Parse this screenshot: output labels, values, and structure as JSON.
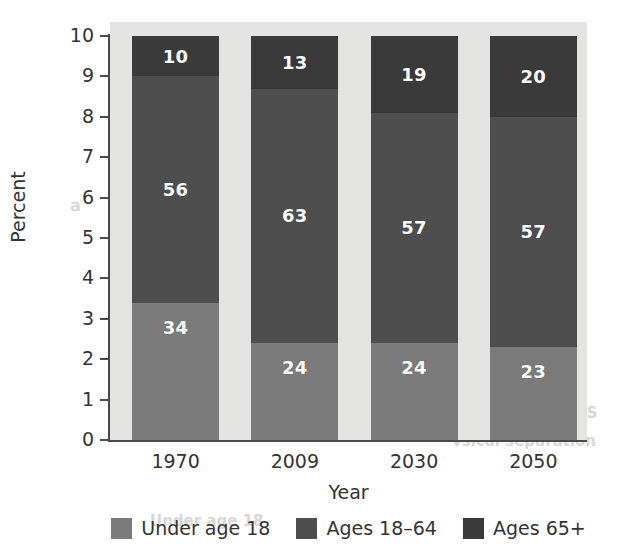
{
  "chart_data": {
    "type": "bar",
    "subtype": "stacked-bar",
    "title": "",
    "xlabel": "Year",
    "ylabel": "Percent",
    "categories": [
      "1970",
      "2009",
      "2030",
      "2050"
    ],
    "series": [
      {
        "name": "Under age 18",
        "values": [
          34,
          24,
          24,
          23
        ],
        "color": "#7b7b7b"
      },
      {
        "name": "Ages 18–64",
        "values": [
          56,
          63,
          57,
          57
        ],
        "color": "#4e4e4e"
      },
      {
        "name": "Ages 65+",
        "values": [
          10,
          13,
          19,
          20
        ],
        "color": "#3a3a3a"
      }
    ],
    "stack_order": [
      "Under age 18",
      "Ages 18–64",
      "Ages 65+"
    ],
    "ylim": [
      0,
      10
    ],
    "yticks": [
      0,
      1,
      2,
      3,
      4,
      5,
      6,
      7,
      8,
      9,
      10
    ],
    "ytick_labels": [
      "0",
      "1",
      "2",
      "3",
      "4",
      "5",
      "6",
      "7",
      "8",
      "9",
      "10"
    ],
    "value_scale": 10,
    "grid": false,
    "legend_position": "bottom",
    "plot_background": "#e3e3e1",
    "axis_color": "#4a4a4a",
    "label_text_color": "#ffffff"
  },
  "axes": {
    "y_title": "Percent",
    "x_title": "Year"
  },
  "legend": {
    "items": [
      {
        "label": "Under age 18",
        "color": "#7b7b7b"
      },
      {
        "label": "Ages 18–64",
        "color": "#4e4e4e"
      },
      {
        "label": "Ages 65+",
        "color": "#3a3a3a"
      }
    ]
  },
  "background_bleed": [
    {
      "text": "in",
      "x": 470,
      "y": 118,
      "size": 15
    },
    {
      "text": "Moder",
      "x": 452,
      "y": 140,
      "size": 17
    },
    {
      "text": "a",
      "x": 70,
      "y": 196,
      "size": 16
    },
    {
      "text": "nsion",
      "x": 456,
      "y": 272,
      "size": 17
    },
    {
      "text": "ve",
      "x": 458,
      "y": 300,
      "size": 15
    },
    {
      "text": "and",
      "x": 452,
      "y": 328,
      "size": 16
    },
    {
      "text": "ALLIED",
      "x": 452,
      "y": 356,
      "size": 16
    },
    {
      "text": "CONSIDERATIONS",
      "x": 448,
      "y": 404,
      "size": 15
    },
    {
      "text": "vsical separation",
      "x": 452,
      "y": 432,
      "size": 15
    },
    {
      "text": "Under age 18",
      "x": 150,
      "y": 512,
      "size": 15
    }
  ]
}
